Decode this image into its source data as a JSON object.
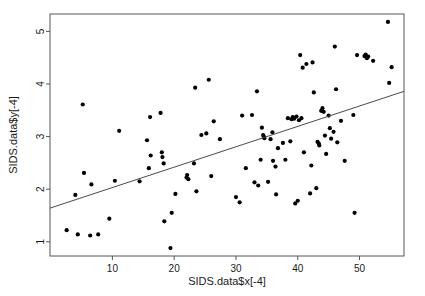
{
  "chart_data": {
    "type": "scatter",
    "title": "",
    "xlabel": "SIDS.data$x[-4]",
    "ylabel": "SIDS.data$y[-4]",
    "xticks": [
      10,
      20,
      30,
      40,
      50
    ],
    "yticks": [
      1,
      2,
      3,
      4,
      5
    ],
    "xlim": [
      -0.1,
      57.2
    ],
    "ylim": [
      0.73,
      5.33
    ],
    "grid": false,
    "legend": null,
    "point_style": {
      "marker": "filled-circle",
      "color": "#000000",
      "size": 2.1
    },
    "trendline": {
      "type": "linear",
      "color": "#4a4a4a",
      "x_endpoints": [
        -0.1,
        57.2
      ],
      "y_endpoints": [
        1.64,
        3.86
      ],
      "slope": 0.0387,
      "intercept": 1.644
    },
    "points": [
      [
        2.6,
        1.22
      ],
      [
        4.0,
        1.89
      ],
      [
        4.4,
        1.14
      ],
      [
        5.2,
        3.61
      ],
      [
        5.4,
        2.31
      ],
      [
        6.4,
        1.12
      ],
      [
        6.6,
        2.09
      ],
      [
        7.7,
        1.14
      ],
      [
        9.5,
        1.44
      ],
      [
        10.4,
        2.16
      ],
      [
        11.1,
        3.11
      ],
      [
        14.4,
        2.15
      ],
      [
        15.6,
        2.93
      ],
      [
        15.9,
        2.4
      ],
      [
        16.1,
        3.37
      ],
      [
        16.2,
        2.64
      ],
      [
        17.8,
        3.45
      ],
      [
        18.0,
        2.7
      ],
      [
        18.1,
        2.61
      ],
      [
        18.3,
        2.49
      ],
      [
        18.4,
        1.39
      ],
      [
        19.4,
        0.88
      ],
      [
        19.6,
        1.55
      ],
      [
        20.2,
        1.91
      ],
      [
        22.0,
        2.22
      ],
      [
        22.1,
        2.27
      ],
      [
        22.3,
        2.19
      ],
      [
        23.2,
        2.49
      ],
      [
        23.4,
        3.93
      ],
      [
        23.6,
        1.96
      ],
      [
        24.4,
        3.03
      ],
      [
        25.2,
        3.06
      ],
      [
        25.6,
        4.08
      ],
      [
        26.0,
        2.25
      ],
      [
        26.4,
        3.29
      ],
      [
        27.4,
        2.95
      ],
      [
        30.0,
        1.85
      ],
      [
        30.6,
        1.75
      ],
      [
        31.0,
        3.4
      ],
      [
        31.6,
        2.4
      ],
      [
        32.6,
        3.41
      ],
      [
        33.0,
        2.13
      ],
      [
        33.4,
        3.86
      ],
      [
        33.6,
        2.07
      ],
      [
        34.0,
        2.56
      ],
      [
        34.2,
        3.17
      ],
      [
        34.4,
        3.03
      ],
      [
        34.5,
        3.0
      ],
      [
        34.6,
        2.97
      ],
      [
        35.2,
        2.14
      ],
      [
        35.6,
        2.95
      ],
      [
        35.9,
        3.08
      ],
      [
        36.0,
        2.54
      ],
      [
        36.4,
        2.43
      ],
      [
        36.5,
        1.9
      ],
      [
        36.8,
        2.78
      ],
      [
        37.6,
        2.88
      ],
      [
        38.0,
        2.56
      ],
      [
        38.4,
        3.35
      ],
      [
        38.8,
        2.91
      ],
      [
        39.0,
        3.33
      ],
      [
        39.2,
        3.37
      ],
      [
        39.4,
        3.34
      ],
      [
        39.6,
        1.73
      ],
      [
        39.8,
        3.38
      ],
      [
        40.0,
        1.78
      ],
      [
        40.2,
        3.31
      ],
      [
        40.4,
        4.55
      ],
      [
        40.6,
        3.35
      ],
      [
        40.8,
        4.31
      ],
      [
        41.0,
        2.7
      ],
      [
        41.4,
        4.38
      ],
      [
        42.0,
        1.92
      ],
      [
        42.2,
        2.45
      ],
      [
        42.4,
        4.41
      ],
      [
        42.6,
        3.84
      ],
      [
        43.0,
        2.02
      ],
      [
        43.2,
        2.9
      ],
      [
        43.4,
        2.87
      ],
      [
        43.5,
        2.83
      ],
      [
        43.8,
        3.49
      ],
      [
        44.0,
        3.54
      ],
      [
        44.2,
        3.47
      ],
      [
        44.4,
        3.02
      ],
      [
        44.6,
        2.67
      ],
      [
        45.0,
        3.4
      ],
      [
        45.2,
        3.16
      ],
      [
        45.4,
        2.96
      ],
      [
        45.8,
        3.09
      ],
      [
        46.0,
        4.71
      ],
      [
        46.2,
        3.9
      ],
      [
        46.4,
        2.89
      ],
      [
        47.0,
        3.3
      ],
      [
        47.6,
        2.54
      ],
      [
        49.0,
        3.41
      ],
      [
        49.2,
        1.55
      ],
      [
        49.6,
        4.55
      ],
      [
        50.8,
        4.53
      ],
      [
        51.0,
        4.56
      ],
      [
        51.2,
        4.49
      ],
      [
        51.4,
        4.52
      ],
      [
        52.2,
        4.44
      ],
      [
        54.6,
        5.18
      ],
      [
        54.8,
        4.02
      ],
      [
        55.2,
        4.32
      ]
    ]
  }
}
